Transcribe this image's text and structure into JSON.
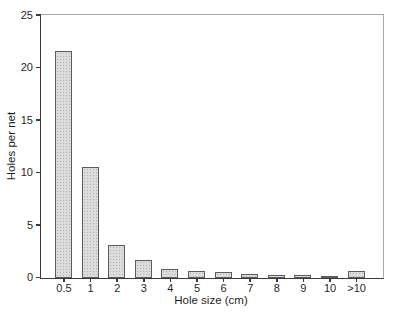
{
  "chart_data": {
    "type": "bar",
    "title": "",
    "categories": [
      "0.5",
      "1",
      "2",
      "3",
      "4",
      "5",
      "6",
      "7",
      "8",
      "9",
      "10",
      ">10"
    ],
    "values": [
      21.6,
      10.6,
      3.1,
      1.7,
      0.9,
      0.65,
      0.55,
      0.35,
      0.3,
      0.25,
      0.15,
      0.7
    ],
    "xlabel": "Hole size (cm)",
    "ylabel": "Holes per net",
    "ylim": [
      0,
      25
    ],
    "yticks": [
      0,
      5,
      10,
      15,
      20,
      25
    ],
    "grid": false,
    "legend_position": "none",
    "colors": {
      "bar_fill": "#dcdcdc",
      "bar_dots": "#b2b2b2",
      "bar_border": "#5c5c5c",
      "axis_dark": "#3a3a3a",
      "axis_light": "#a8a8a8",
      "text": "#1f1f1f",
      "background": "#ffffff"
    }
  }
}
